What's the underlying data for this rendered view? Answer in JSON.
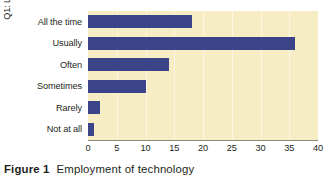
{
  "chart_data": {
    "type": "bar",
    "orientation": "horizontal",
    "title": "",
    "xlabel": "",
    "ylabel": "Q1: Liklihood of employing\ntechnology?",
    "categories": [
      "All the time",
      "Usually",
      "Often",
      "Sometimes",
      "Rarely",
      "Not at all"
    ],
    "values": [
      18,
      36,
      14,
      10,
      2,
      1
    ],
    "xlim": [
      0,
      40
    ],
    "xticks": [
      0,
      5,
      10,
      15,
      20,
      25,
      30,
      35,
      40
    ],
    "xtick_labels": [
      "0",
      "5",
      "10",
      "15",
      "20",
      "25",
      "30",
      "35",
      "40"
    ],
    "grid": "vertical",
    "legend": "none",
    "bar_color": "#3b4488",
    "plot_background": "#f7edc4",
    "gridline_color": "#ffffff"
  },
  "caption": {
    "label": "Figure 1",
    "text": "Employment of technology"
  }
}
